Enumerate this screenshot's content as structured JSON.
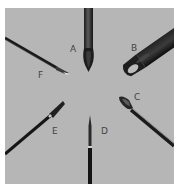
{
  "image": {
    "subject": "Six needle tips of different types arranged radially on a gray background",
    "background_color": "#b6b6b6",
    "border_color": "#ffffff"
  },
  "needles": [
    {
      "id": "A",
      "label": "A",
      "description": "vertical needle from top, bevel facing viewer"
    },
    {
      "id": "B",
      "label": "B",
      "description": "large-bore needle from upper right, rounded bevel"
    },
    {
      "id": "C",
      "label": "C",
      "description": "needle from lower right, open bevel"
    },
    {
      "id": "D",
      "label": "D",
      "description": "fine vertical needle from bottom"
    },
    {
      "id": "E",
      "label": "E",
      "description": "needle from lower left"
    },
    {
      "id": "F",
      "label": "F",
      "description": "thin needle from upper left"
    }
  ]
}
